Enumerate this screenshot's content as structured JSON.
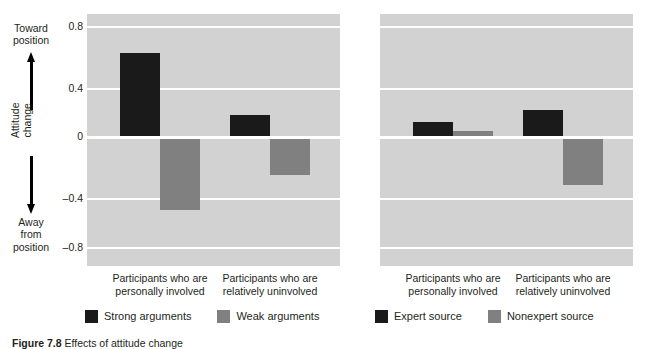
{
  "figure": {
    "caption_label": "Figure 7.8",
    "caption_text": "Effects of attitude change"
  },
  "yaxis": {
    "annotation_top": "Toward\nposition",
    "annotation_bottom": "Away\nfrom\nposition",
    "title": "Attitude\nchange",
    "ticks": [
      "0.8",
      "0.4",
      "0",
      "–0.4",
      "–0.8"
    ]
  },
  "colors": {
    "plot_background": "#d2d2d2",
    "gridline": "#ffffff",
    "dark_series": "#1a1a1a",
    "light_series": "#808080",
    "text": "#231f20"
  },
  "panels": [
    {
      "id": "argument-quality",
      "categories": [
        "Participants who are\npersonally involved",
        "Participants who are\nrelatively uninvolved"
      ],
      "legend": [
        {
          "label": "Strong arguments",
          "color": "#1a1a1a"
        },
        {
          "label": "Weak arguments",
          "color": "#808080"
        }
      ]
    },
    {
      "id": "source-expertise",
      "categories": [
        "Participants who are\npersonally involved",
        "Participants who are\nrelatively uninvolved"
      ],
      "legend": [
        {
          "label": "Expert source",
          "color": "#1a1a1a"
        },
        {
          "label": "Nonexpert source",
          "color": "#808080"
        }
      ]
    }
  ],
  "chart_data": [
    {
      "type": "bar",
      "title": "",
      "xlabel": "",
      "ylabel": "Attitude change",
      "ylim": [
        -1.0,
        1.0
      ],
      "yticks": [
        0.8,
        0.4,
        0,
        -0.4,
        -0.8
      ],
      "grid": true,
      "legend_position": "bottom",
      "categories": [
        "Participants who are personally involved",
        "Participants who are relatively uninvolved"
      ],
      "series": [
        {
          "name": "Strong arguments",
          "color": "#1a1a1a",
          "values": [
            0.61,
            0.14
          ]
        },
        {
          "name": "Weak arguments",
          "color": "#808080",
          "values": [
            -0.47,
            -0.24
          ]
        }
      ]
    },
    {
      "type": "bar",
      "title": "",
      "xlabel": "",
      "ylabel": "Attitude change",
      "ylim": [
        -1.0,
        1.0
      ],
      "yticks": [
        0.8,
        0.4,
        0,
        -0.4,
        -0.8
      ],
      "grid": true,
      "legend_position": "bottom",
      "categories": [
        "Participants who are personally involved",
        "Participants who are relatively uninvolved"
      ],
      "series": [
        {
          "name": "Expert source",
          "color": "#1a1a1a",
          "values": [
            0.09,
            0.17
          ]
        },
        {
          "name": "Nonexpert source",
          "color": "#808080",
          "values": [
            0.03,
            -0.3
          ]
        }
      ]
    }
  ]
}
